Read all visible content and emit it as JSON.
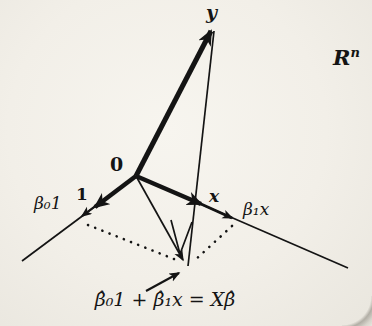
{
  "figure": {
    "labels": {
      "y_vector": "y",
      "space_base": "R",
      "space_sup": "n",
      "origin": "0",
      "one_vector": "1",
      "beta0_one": "β₀1",
      "x_vector": "x",
      "beta1_x": "β₁x",
      "equation": "β̂₀1 + β̂₁x = Xβ̂"
    },
    "colors": {
      "ink": "#141414",
      "paper": "#f2efe8"
    }
  }
}
